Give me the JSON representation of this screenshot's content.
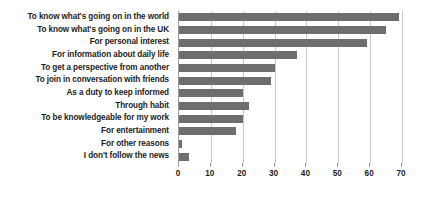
{
  "chart_data": {
    "type": "bar",
    "orientation": "horizontal",
    "title": "",
    "subtitle": "",
    "xlabel": "",
    "ylabel": "",
    "xlim": [
      0,
      70
    ],
    "xticks": [
      0,
      10,
      20,
      30,
      40,
      50,
      60,
      70
    ],
    "grid": "vertical",
    "legend": "none",
    "bar_color": "#6e6e6e",
    "categories": [
      "To know what's going on in the world",
      "To know what's going on in the UK",
      "For personal interest",
      "For information about daily life",
      "To get a perspective from another",
      "To join in conversation with friends",
      "As a duty to keep informed",
      "Through habit",
      "To be knowledgeable for my work",
      "For entertainment",
      "For other reasons",
      "I don't follow the news"
    ],
    "values": [
      69,
      65,
      59,
      37,
      30,
      29,
      20,
      22,
      20,
      18,
      1,
      3
    ]
  }
}
